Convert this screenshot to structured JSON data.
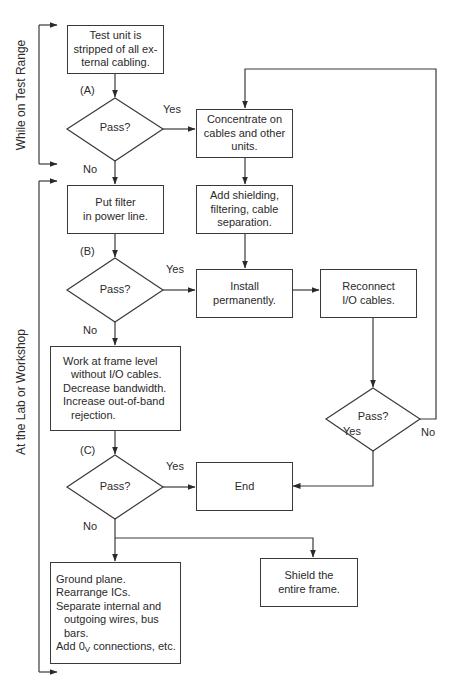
{
  "side_labels": {
    "test_range": "While on Test Range",
    "lab": "At the Lab or Workshop"
  },
  "steps": {
    "strip": "Test unit is\nstripped of all ex-\nternal cabling.",
    "concentrate": "Concentrate on\ncables and other\nunits.",
    "put_filter": "Put filter\nin power line.",
    "add_shielding": "Add shielding,\nfiltering, cable\nseparation.",
    "install": "Install\npermanently.",
    "reconnect": "Reconnect\nI/O cables.",
    "work_frame": {
      "lines": [
        "Work at frame level",
        "without I/O cables.",
        "Decrease bandwidth.",
        "Increase out-of-band",
        "rejection."
      ]
    },
    "end": "End",
    "ground": {
      "lines": [
        "Ground plane.",
        "Rearrange ICs.",
        "Separate internal and",
        "outgoing wires, bus",
        "bars."
      ],
      "last_prefix": "Add 0",
      "last_sub": "V",
      "last_suffix": " connections, etc."
    },
    "shield_frame": "Shield the\nentire frame."
  },
  "decisions": {
    "a": {
      "tag": "(A)",
      "text": "Pass?",
      "yes": "Yes",
      "no": "No"
    },
    "b": {
      "tag": "(B)",
      "text": "Pass?",
      "yes": "Yes",
      "no": "No"
    },
    "c": {
      "tag": "(C)",
      "text": "Pass?",
      "yes": "Yes",
      "no": "No"
    },
    "d": {
      "text": "Pass?",
      "yes": "Yes",
      "no": "No"
    }
  }
}
